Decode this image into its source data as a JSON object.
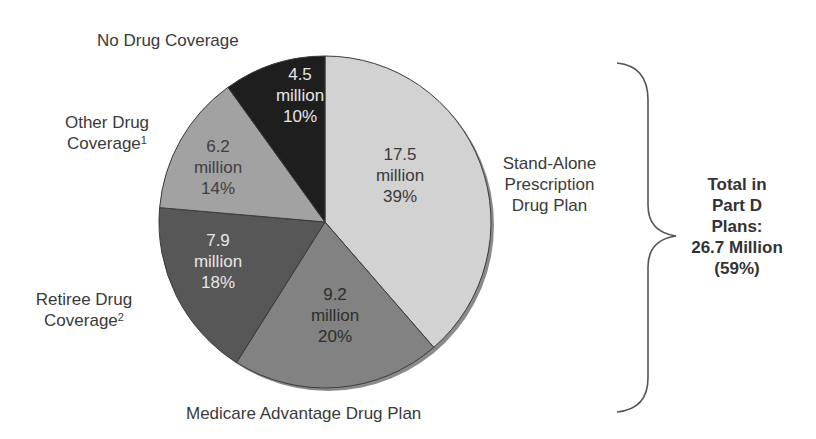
{
  "chart_data": {
    "type": "pie",
    "title": "",
    "unit": "million",
    "start_angle_deg": 0,
    "direction": "clockwise",
    "slices": [
      {
        "label": "Stand-Alone Prescription Drug Plan",
        "value": 17.5,
        "percent": 39,
        "value_text": "17.5",
        "unit_text": "million",
        "pct_text": "39%",
        "color": "#d2d2d2",
        "text_color": "#3a3a3a"
      },
      {
        "label": "Medicare Advantage Drug Plan",
        "value": 9.2,
        "percent": 20,
        "value_text": "9.2",
        "unit_text": "million",
        "pct_text": "20%",
        "color": "#828282",
        "text_color": "#2e2e2e"
      },
      {
        "label": "Retiree Drug Coverage",
        "footnote": "2",
        "value": 7.9,
        "percent": 18,
        "value_text": "7.9",
        "unit_text": "million",
        "pct_text": "18%",
        "color": "#575757",
        "text_color": "#e6e6e6"
      },
      {
        "label": "Other Drug Coverage",
        "footnote": "1",
        "value": 6.2,
        "percent": 14,
        "value_text": "6.2",
        "unit_text": "million",
        "pct_text": "14%",
        "color": "#a2a2a2",
        "text_color": "#404040"
      },
      {
        "label": "No Drug Coverage",
        "value": 4.5,
        "percent": 10,
        "value_text": "4.5",
        "unit_text": "million",
        "pct_text": "10%",
        "color": "#1e1e1e",
        "text_color": "#e6e6e6"
      }
    ],
    "annotation": {
      "lines": [
        "Total in",
        "Part D",
        "Plans:",
        "26.7 Million",
        "(59%)"
      ],
      "brace_covers": [
        "Stand-Alone Prescription Drug Plan",
        "Medicare Advantage Drug Plan"
      ]
    }
  },
  "labels": {
    "no_drug": "No Drug Coverage",
    "other_line1": "Other Drug",
    "other_line2": "Coverage",
    "other_fn": "1",
    "standalone_line1": "Stand-Alone",
    "standalone_line2": "Prescription",
    "standalone_line3": "Drug Plan",
    "retiree_line1": "Retiree Drug",
    "retiree_line2": "Coverage",
    "retiree_fn": "2",
    "ma": "Medicare Advantage Drug Plan"
  },
  "total": {
    "line1": "Total in",
    "line2": "Part D",
    "line3": "Plans:",
    "line4": "26.7 Million",
    "line5": "(59%)"
  }
}
